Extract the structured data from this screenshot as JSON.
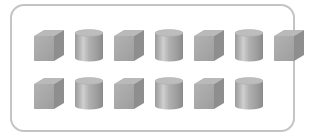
{
  "figure": {
    "colors": {
      "frame": "#c4c4c4",
      "cube_top": "#b9b9b9",
      "cube_front": "#a4a4a4",
      "cube_side": "#8e8e8e",
      "cyl_top": "#bdbdbd",
      "cyl_body_light": "#c8c8c8",
      "cyl_body_dark": "#8f8f8f"
    },
    "rows": [
      {
        "shapes": [
          "cube",
          "cylinder",
          "cube",
          "cylinder",
          "cube",
          "cylinder",
          "cube"
        ]
      },
      {
        "shapes": [
          "cube",
          "cylinder",
          "cube",
          "cylinder",
          "cube",
          "cylinder"
        ]
      }
    ],
    "counts": {
      "cubes": 7,
      "cylinders": 6,
      "total": 13
    }
  }
}
